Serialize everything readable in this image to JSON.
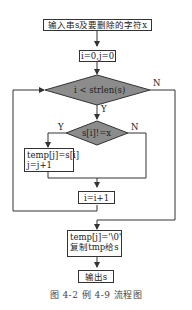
{
  "figure": {
    "caption": "图 4-2   例 4-9 流程图"
  },
  "nodes": {
    "input": "输入串s及要删除的字符x",
    "init": "i=0,j=0",
    "cond_loop": "i < strlen(s)",
    "cond_char": "s[i]!=x",
    "copy_line1": "temp[j]=s[i]",
    "copy_line2": "j=j+1",
    "increment": "i=i+1",
    "finish_line1": "temp[j]='\\0'",
    "finish_line2": "复制tmp给s",
    "output": "输出s"
  },
  "edge_labels": {
    "loop_yes": "Y",
    "loop_no": "N",
    "char_yes": "Y",
    "char_no": "N"
  },
  "colors": {
    "diamond_fill": "#8c8c8c",
    "line": "#333333"
  }
}
